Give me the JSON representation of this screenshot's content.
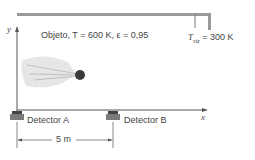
{
  "diagram": {
    "object_label": "Objeto, T = 600 K, ε = 0,95",
    "surroundings_label": "T_viz = 300 K",
    "surroundings_symbol": "T",
    "surroundings_sub": "viz",
    "surroundings_value": "= 300 K",
    "axis_y": "y",
    "axis_x": "x",
    "detector_a": "Detector A",
    "detector_b": "Detector B",
    "distance": "5 m",
    "colors": {
      "line": "#555555",
      "wall": "#9a9a9a",
      "ball": "#3a3a3a",
      "detector": "#6e6e6e",
      "plume": "#e2e2e2"
    }
  }
}
